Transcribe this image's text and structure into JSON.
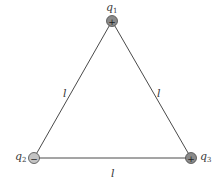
{
  "diagram": {
    "type": "equilateral triangle of point charges",
    "side_label": "l",
    "colors": {
      "line": "#4a4a4a",
      "positive_fill": "#8a8a8a",
      "negative_fill": "#c4c4c4",
      "charge_stroke": "#4a4a4a",
      "sign": "#222222"
    },
    "charges": [
      {
        "id": "q1",
        "symbol": "q",
        "subscript": "1",
        "sign": "+",
        "sign_glyph": "+"
      },
      {
        "id": "q2",
        "symbol": "q",
        "subscript": "2",
        "sign": "-",
        "sign_glyph": "−"
      },
      {
        "id": "q3",
        "symbol": "q",
        "subscript": "3",
        "sign": "+",
        "sign_glyph": "+"
      }
    ],
    "sides": [
      {
        "between": "q1-q2",
        "label": "l"
      },
      {
        "between": "q1-q3",
        "label": "l"
      },
      {
        "between": "q2-q3",
        "label": "l"
      }
    ]
  }
}
